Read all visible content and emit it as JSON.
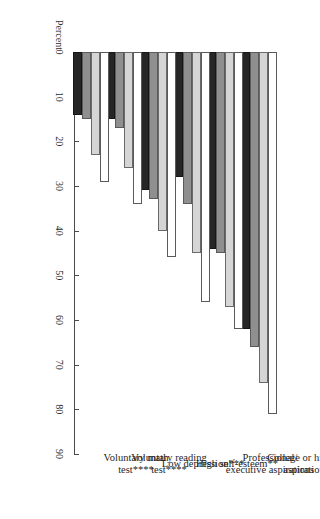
{
  "chart_data": {
    "type": "bar",
    "title": "",
    "xlabel": "",
    "ylabel": "Percent",
    "ylim": [
      0,
      90
    ],
    "grid": false,
    "orientation": "vertical-grouped-rotated",
    "legend_position": "none",
    "yticks": [
      0,
      10,
      20,
      30,
      40,
      50,
      60,
      70,
      80,
      90
    ],
    "ytick_labels": [
      "0",
      "10",
      "20",
      "30",
      "40",
      "50",
      "60",
      "70",
      "80",
      "90"
    ],
    "categories": [
      "College or higher aspiration",
      "Professional/ executive aspirations",
      "High self-esteem**",
      "Low depression***",
      "Voluntary reading test****",
      "Voluntary math test****"
    ],
    "series": [
      {
        "name": "series-1",
        "color": "#ffffff",
        "values": [
          81,
          62,
          56,
          46,
          34,
          29
        ]
      },
      {
        "name": "series-2",
        "color": "#d5d5d5",
        "values": [
          74,
          57,
          45,
          40,
          26,
          23
        ]
      },
      {
        "name": "series-3",
        "color": "#8f8f8f",
        "values": [
          66,
          45,
          34,
          33,
          17,
          15
        ]
      },
      {
        "name": "series-4",
        "color": "#262626",
        "values": [
          62,
          44,
          28,
          31,
          15,
          14
        ]
      }
    ]
  },
  "axis": {
    "percent_label": "Percent"
  }
}
